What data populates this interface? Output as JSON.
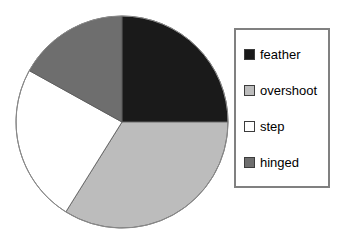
{
  "chart_data": {
    "type": "pie",
    "title": "",
    "labels": [
      "feather",
      "overshoot",
      "step",
      "hinged"
    ],
    "values": [
      25,
      34,
      24,
      17
    ],
    "units": "percent",
    "colors": [
      "#1a1a1a",
      "#bcbcbc",
      "#ffffff",
      "#6e6e6e"
    ],
    "start_angle_deg": 0,
    "direction": "clockwise",
    "legend_position": "right",
    "grid": false,
    "slice_angles_deg": [
      {
        "label": "feather",
        "start": 0,
        "end": 90
      },
      {
        "label": "overshoot",
        "start": 90,
        "end": 212
      },
      {
        "label": "step",
        "start": 212,
        "end": 299
      },
      {
        "label": "hinged",
        "start": 299,
        "end": 360
      }
    ]
  },
  "pie": {
    "center_x": 107,
    "center_y": 107,
    "radius": 106,
    "outline_color": "#8a8a8a"
  },
  "legend": {
    "border_color": "#808080",
    "items": [
      {
        "label": "feather",
        "color": "#1a1a1a"
      },
      {
        "label": "overshoot",
        "color": "#bcbcbc"
      },
      {
        "label": "step",
        "color": "#ffffff"
      },
      {
        "label": "hinged",
        "color": "#6e6e6e"
      }
    ]
  }
}
